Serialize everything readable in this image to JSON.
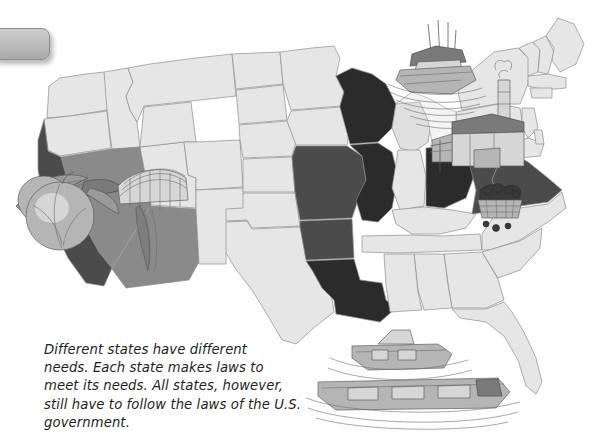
{
  "page": {
    "title": "Different states have different needs",
    "background_color": "#ffffff",
    "width": 609,
    "height": 433
  },
  "corner_tab": {
    "label": "",
    "fill_color": "#bdbdbd",
    "border_color": "#8e8e8e"
  },
  "caption": {
    "lines": [
      "Different states have different",
      "needs. Each state makes laws to",
      "meet its needs.  All states, however,",
      "still have to follow the laws of the U.S.",
      "government."
    ],
    "full_text": "Different states have different needs. Each state makes laws to meet its needs.  All states, however, still have to follow the laws of the U.S. government.",
    "text_color": "#1d1d1d",
    "style": "italic"
  },
  "map": {
    "name": "united-states-map",
    "base_state_color": "#e6e6e6",
    "outline_color": "#8d8d8d",
    "shading_legend": [
      {
        "key": "light",
        "color": "#e6e6e6",
        "meaning": "unhighlighted state"
      },
      {
        "key": "medium",
        "color": "#8a8a8a",
        "meaning": "shaded state"
      },
      {
        "key": "dark",
        "color": "#4b4b4b",
        "meaning": "darker shaded state"
      },
      {
        "key": "black",
        "color": "#2b2b2b",
        "meaning": "darkest shaded state"
      }
    ],
    "highlighted_states": [
      {
        "name": "California",
        "shade": "dark"
      },
      {
        "name": "Nevada",
        "shade": "medium"
      },
      {
        "name": "Arizona",
        "shade": "medium"
      },
      {
        "name": "Wisconsin",
        "shade": "black"
      },
      {
        "name": "Illinois",
        "shade": "black"
      },
      {
        "name": "Missouri",
        "shade": "dark"
      },
      {
        "name": "Arkansas",
        "shade": "dark"
      },
      {
        "name": "Louisiana",
        "shade": "black"
      },
      {
        "name": "Ohio",
        "shade": "black"
      },
      {
        "name": "West Virginia",
        "shade": "dark"
      },
      {
        "name": "Virginia",
        "shade": "dark"
      }
    ],
    "illustrations": [
      {
        "name": "peach-fruit-illustration",
        "region": "California",
        "depicts": "peach with leaves"
      },
      {
        "name": "dam-illustration",
        "region": "Nevada / Arizona",
        "depicts": "hydroelectric dam"
      },
      {
        "name": "ship-cargo-illustration",
        "region": "Great Lakes",
        "depicts": "cargo ship on the lakes"
      },
      {
        "name": "factory-illustration",
        "region": "Great Lakes / Ohio",
        "depicts": "factory with smokestack"
      },
      {
        "name": "coal-basket-illustration",
        "region": "West Virginia",
        "depicts": "basket of coal"
      },
      {
        "name": "barge-boats-illustration",
        "region": "Gulf of Mexico",
        "depicts": "tugboat and barge"
      }
    ]
  }
}
